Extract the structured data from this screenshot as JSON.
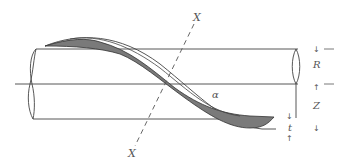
{
  "diagram": {
    "type": "helical blade on cylinder cross-section schematic",
    "colors": {
      "line": "#444444",
      "blade_fill": "#7a7a7a",
      "background": "#ffffff",
      "label": "#555555"
    },
    "labels": {
      "axis_top": "X",
      "axis_bottom": "X",
      "radius": "R",
      "pitch": "Z",
      "thickness": "t",
      "angle": "α"
    },
    "arrows": {
      "r_top": "↓",
      "r_bottom": "↑",
      "z_bottom": "↓",
      "t_top": "↓",
      "t_bottom": "↑"
    }
  }
}
